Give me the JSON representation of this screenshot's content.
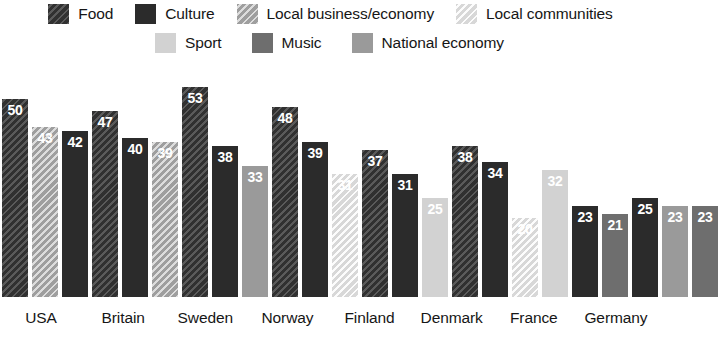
{
  "legend": {
    "rows": [
      [
        {
          "label": "Food",
          "key": "food",
          "swatch": "food-swatch"
        },
        {
          "label": "Culture",
          "key": "culture",
          "swatch": "culture-swatch"
        },
        {
          "label": "Local business/economy",
          "key": "localbiz",
          "swatch": "local-business-swatch"
        },
        {
          "label": "Local communities",
          "key": "localcomm",
          "swatch": "local-communities-swatch"
        }
      ],
      [
        {
          "label": "Sport",
          "key": "sport",
          "swatch": "sport-swatch"
        },
        {
          "label": "Music",
          "key": "music",
          "swatch": "music-swatch"
        },
        {
          "label": "National economy",
          "key": "nationalecon",
          "swatch": "national-economy-swatch"
        }
      ]
    ]
  },
  "colors": {
    "food": "#3b3b3b",
    "culture": "#2b2b2b",
    "localbiz": "#b3b3b3",
    "localcomm": "#ebebeb",
    "sport": "#d2d2d2",
    "music": "#6e6e6e",
    "nationalecon": "#9a9a9a",
    "background": "#ffffff",
    "text": "#161616"
  },
  "chart_data": {
    "type": "bar",
    "title": "",
    "subtitle": "",
    "xlabel": "",
    "ylabel": "",
    "ylim": [
      0,
      55
    ],
    "grid": false,
    "legend_position": "top",
    "value_labels": true,
    "categories": [
      "USA",
      "Britain",
      "Sweden",
      "Norway",
      "Finland",
      "Denmark",
      "France",
      "Germany"
    ],
    "series": [
      {
        "name": "Food",
        "values": [
          50,
          47,
          53,
          48,
          37,
          38,
          null,
          null
        ]
      },
      {
        "name": "Culture",
        "values": [
          42,
          40,
          38,
          39,
          31,
          34,
          23,
          25
        ]
      },
      {
        "name": "Local business/economy",
        "values": [
          43,
          39,
          null,
          null,
          null,
          null,
          null,
          null
        ]
      },
      {
        "name": "Local communities",
        "values": [
          null,
          null,
          null,
          31,
          null,
          20,
          null,
          null
        ]
      },
      {
        "name": "Sport",
        "values": [
          null,
          null,
          null,
          null,
          25,
          null,
          32,
          null
        ]
      },
      {
        "name": "Music",
        "values": [
          null,
          null,
          null,
          null,
          null,
          null,
          21,
          23
        ]
      },
      {
        "name": "National economy",
        "values": [
          null,
          null,
          33,
          null,
          null,
          null,
          null,
          23
        ]
      }
    ],
    "groups": [
      {
        "category": "USA",
        "bars": [
          {
            "series": "Food",
            "key": "food",
            "value": 50
          },
          {
            "series": "Local business/economy",
            "key": "localbiz",
            "value": 43
          },
          {
            "series": "Culture",
            "key": "culture",
            "value": 42
          }
        ]
      },
      {
        "category": "Britain",
        "bars": [
          {
            "series": "Food",
            "key": "food",
            "value": 47
          },
          {
            "series": "Culture",
            "key": "culture",
            "value": 40
          },
          {
            "series": "Local business/economy",
            "key": "localbiz",
            "value": 39
          }
        ]
      },
      {
        "category": "Sweden",
        "bars": [
          {
            "series": "Food",
            "key": "food",
            "value": 53
          },
          {
            "series": "Culture",
            "key": "culture",
            "value": 38
          },
          {
            "series": "National economy",
            "key": "nationalecon",
            "value": 33
          }
        ]
      },
      {
        "category": "Norway",
        "bars": [
          {
            "series": "Food",
            "key": "food",
            "value": 48
          },
          {
            "series": "Culture",
            "key": "culture",
            "value": 39
          },
          {
            "series": "Local communities",
            "key": "localcomm",
            "value": 31
          }
        ]
      },
      {
        "category": "Finland",
        "bars": [
          {
            "series": "Food",
            "key": "food",
            "value": 37
          },
          {
            "series": "Culture",
            "key": "culture",
            "value": 31
          },
          {
            "series": "Sport",
            "key": "sport",
            "value": 25
          }
        ]
      },
      {
        "category": "Denmark",
        "bars": [
          {
            "series": "Food",
            "key": "food",
            "value": 38
          },
          {
            "series": "Culture",
            "key": "culture",
            "value": 34
          },
          {
            "series": "Local communities",
            "key": "localcomm",
            "value": 20
          }
        ]
      },
      {
        "category": "France",
        "bars": [
          {
            "series": "Sport",
            "key": "sport",
            "value": 32
          },
          {
            "series": "Culture",
            "key": "culture",
            "value": 23
          },
          {
            "series": "Music",
            "key": "music",
            "value": 21
          }
        ]
      },
      {
        "category": "Germany",
        "bars": [
          {
            "series": "Culture",
            "key": "culture",
            "value": 25
          },
          {
            "series": "National economy",
            "key": "nationalecon",
            "value": 23
          },
          {
            "series": "Music",
            "key": "music",
            "value": 23
          }
        ]
      }
    ]
  }
}
